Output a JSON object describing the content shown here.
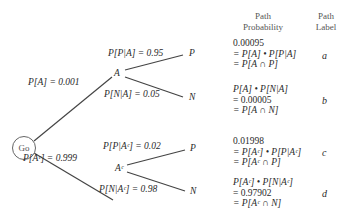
{
  "root": {
    "label": "Go"
  },
  "branches": {
    "A": {
      "node": "A",
      "prob": "P[A] = 0.001"
    },
    "Ac": {
      "node": "Aᶜ",
      "prob": "P[Aᶜ] = 0.999"
    }
  },
  "sub_branches": {
    "P_given_A": {
      "leaf": "P",
      "prob": "P[P|A] = 0.95"
    },
    "N_given_A": {
      "leaf": "N",
      "prob": "P[N|A] = 0.05"
    },
    "P_given_Ac": {
      "leaf": "P",
      "prob": "P[P|Aᶜ] = 0.02"
    },
    "N_given_Ac": {
      "leaf": "N",
      "prob": "P[N|Aᶜ] = 0.98"
    }
  },
  "headers": {
    "path_probability": [
      "Path",
      "Probability"
    ],
    "path_label": [
      "Path",
      "Label"
    ]
  },
  "paths": [
    {
      "lines": [
        "0.00095",
        "= P[A] • P[P|A]",
        "= P[A ∩ P]"
      ],
      "label": "a"
    },
    {
      "lines": [
        "P[A] • P[N|A]",
        "= 0.00005",
        "= P[A ∩ N]"
      ],
      "label": "b"
    },
    {
      "lines": [
        "0.01998",
        "= P[Aᶜ] • P[P|Aᶜ]",
        "= P[Aᶜ ∩ P]"
      ],
      "label": "c"
    },
    {
      "lines": [
        "P[Aᶜ] • P[N|Aᶜ]",
        "= 0.97902",
        "= P[Aᶜ ∩ N]"
      ],
      "label": "d"
    }
  ]
}
